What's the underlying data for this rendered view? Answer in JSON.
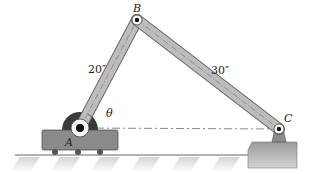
{
  "diagram": {
    "type": "mechanism",
    "points": {
      "A": {
        "label": "A",
        "x": 80,
        "y": 128
      },
      "B": {
        "label": "B",
        "x": 137,
        "y": 20
      },
      "C": {
        "label": "C",
        "x": 279,
        "y": 129
      }
    },
    "links": [
      {
        "from": "A",
        "to": "B",
        "length_label": "20″"
      },
      {
        "from": "B",
        "to": "C",
        "length_label": "30″"
      }
    ],
    "angle": {
      "label": "θ",
      "vertex": "A",
      "between": "AB and horizontal AC"
    },
    "colors": {
      "link_fill": "#b9b9b9",
      "link_stroke": "#6a6a6a",
      "cart_fill": "#8a8a8a",
      "ground_hatch": "#d8d8d8",
      "text": "#222222"
    }
  }
}
